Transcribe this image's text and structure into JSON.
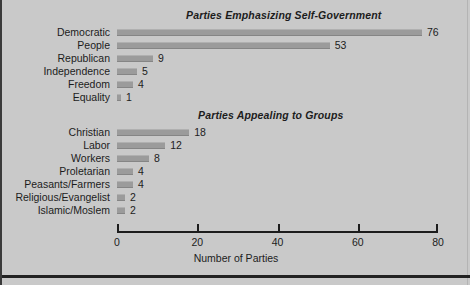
{
  "chart_data": {
    "type": "bar",
    "orientation": "horizontal",
    "title": "",
    "xlabel": "Number of Parties",
    "ylabel": "",
    "xlim": [
      0,
      80
    ],
    "xticks": [
      0,
      20,
      40,
      60,
      80
    ],
    "xtick_labels": [
      "0",
      "20",
      "40",
      "60",
      "80"
    ],
    "grid": false,
    "legend": null,
    "bar_color": "#9b9b9b",
    "background_color": "#c9c9c9",
    "panels": [
      {
        "title": "Parties Emphasizing Self-Government",
        "categories": [
          "Democratic",
          "People",
          "Republican",
          "Independence",
          "Freedom",
          "Equality"
        ],
        "values": [
          76,
          53,
          9,
          5,
          4,
          1
        ]
      },
      {
        "title": "Parties Appealing to Groups",
        "categories": [
          "Christian",
          "Labor",
          "Workers",
          "Proletarian",
          "Peasants/Farmers",
          "Religious/Evangelist",
          "Islamic/Moslem"
        ],
        "values": [
          18,
          12,
          8,
          4,
          4,
          2,
          2
        ]
      }
    ]
  },
  "panel_one": {
    "title": "Parties Emphasizing Self-Government",
    "rows": [
      {
        "label": "Democratic",
        "value": "76"
      },
      {
        "label": "People",
        "value": "53"
      },
      {
        "label": "Republican",
        "value": "9"
      },
      {
        "label": "Independence",
        "value": "5"
      },
      {
        "label": "Freedom",
        "value": "4"
      },
      {
        "label": "Equality",
        "value": "1"
      }
    ]
  },
  "panel_two": {
    "title": "Parties Appealing to Groups",
    "rows": [
      {
        "label": "Christian",
        "value": "18"
      },
      {
        "label": "Labor",
        "value": "12"
      },
      {
        "label": "Workers",
        "value": "8"
      },
      {
        "label": "Proletarian",
        "value": "4"
      },
      {
        "label": "Peasants/Farmers",
        "value": "4"
      },
      {
        "label": "Religious/Evangelist",
        "value": "2"
      },
      {
        "label": "Islamic/Moslem",
        "value": "2"
      }
    ]
  },
  "axis": {
    "title": "Number of Parties",
    "ticks": [
      "0",
      "20",
      "40",
      "60",
      "80"
    ]
  }
}
